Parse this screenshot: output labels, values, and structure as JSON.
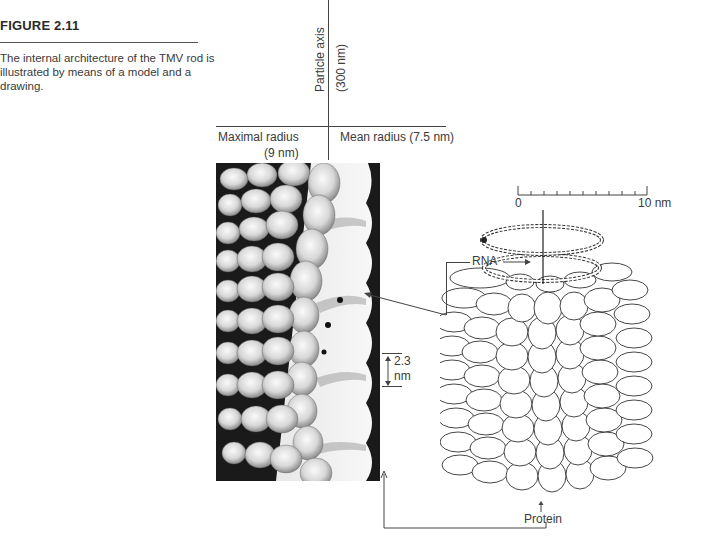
{
  "figure": {
    "number": "FIGURE 2.11",
    "caption": "The internal architecture of the TMV rod is illustrated by means of a model and a drawing."
  },
  "axis_labels": {
    "particle_axis": "Particle axis",
    "particle_axis_length": "(300 nm)",
    "maximal_radius": "Maximal radius",
    "maximal_radius_value": "(9 nm)",
    "mean_radius": "Mean radius (7.5 nm)"
  },
  "scale_bar": {
    "start": "0",
    "end": "10 nm",
    "ticks": 10
  },
  "annotations": {
    "rna": "RNA",
    "pitch_value": "2.3",
    "pitch_unit": "nm",
    "protein": "Protein"
  },
  "colors": {
    "text": "#3a3a3a",
    "line": "#444444",
    "photo_dark": "#141414",
    "photo_light": "#f2f2f2"
  }
}
